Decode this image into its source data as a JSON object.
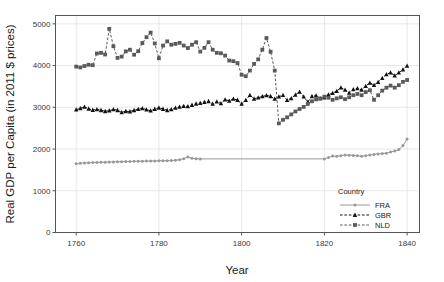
{
  "chart_data": {
    "type": "line",
    "title": "",
    "xlabel": "Year",
    "ylabel": "Real GDP per Capita (in 2011 $ prices)",
    "xlim": [
      1755,
      1843
    ],
    "ylim": [
      0,
      5200
    ],
    "xticks": [
      1760,
      1780,
      1800,
      1820,
      1840
    ],
    "yticks": [
      0,
      1000,
      2000,
      3000,
      4000,
      5000
    ],
    "grid": true,
    "legend_title": "Country",
    "legend_position": "inside-bottom-right",
    "series": [
      {
        "name": "FRA",
        "color": "#999999",
        "linestyle": "solid",
        "marker": "circle",
        "x": [
          1760,
          1761,
          1762,
          1763,
          1764,
          1765,
          1766,
          1767,
          1768,
          1769,
          1770,
          1771,
          1772,
          1773,
          1774,
          1775,
          1776,
          1777,
          1778,
          1779,
          1780,
          1781,
          1782,
          1783,
          1784,
          1785,
          1786,
          1787,
          1788,
          1789,
          1790,
          1820,
          1821,
          1822,
          1823,
          1824,
          1825,
          1826,
          1827,
          1828,
          1829,
          1830,
          1831,
          1832,
          1833,
          1834,
          1835,
          1836,
          1837,
          1838,
          1839,
          1840
        ],
        "values": [
          1648,
          1661,
          1668,
          1672,
          1676,
          1680,
          1684,
          1686,
          1690,
          1692,
          1696,
          1698,
          1700,
          1702,
          1705,
          1707,
          1710,
          1712,
          1714,
          1716,
          1718,
          1720,
          1722,
          1726,
          1730,
          1746,
          1769,
          1812,
          1780,
          1766,
          1764,
          1764,
          1800,
          1832,
          1826,
          1840,
          1858,
          1852,
          1846,
          1838,
          1828,
          1842,
          1858,
          1872,
          1884,
          1892,
          1902,
          1928,
          1952,
          1986,
          2082,
          2238
        ]
      },
      {
        "name": "GBR",
        "color": "#111111",
        "linestyle": "dashed",
        "marker": "triangle",
        "x": [
          1760,
          1761,
          1762,
          1763,
          1764,
          1765,
          1766,
          1767,
          1768,
          1769,
          1770,
          1771,
          1772,
          1773,
          1774,
          1775,
          1776,
          1777,
          1778,
          1779,
          1780,
          1781,
          1782,
          1783,
          1784,
          1785,
          1786,
          1787,
          1788,
          1789,
          1790,
          1791,
          1792,
          1793,
          1794,
          1795,
          1796,
          1797,
          1798,
          1799,
          1800,
          1801,
          1802,
          1803,
          1804,
          1805,
          1806,
          1807,
          1808,
          1809,
          1810,
          1811,
          1812,
          1813,
          1814,
          1815,
          1816,
          1817,
          1818,
          1819,
          1820,
          1821,
          1822,
          1823,
          1824,
          1825,
          1826,
          1827,
          1828,
          1829,
          1830,
          1831,
          1832,
          1833,
          1834,
          1835,
          1836,
          1837,
          1838,
          1839,
          1840
        ],
        "values": [
          2945,
          2975,
          3010,
          2965,
          2935,
          2950,
          2930,
          2905,
          2920,
          2950,
          2930,
          2880,
          2905,
          2900,
          2930,
          2955,
          2975,
          2945,
          2920,
          2960,
          2990,
          2960,
          2930,
          2950,
          2985,
          3010,
          3030,
          3020,
          3055,
          3085,
          3100,
          3125,
          3145,
          3080,
          3135,
          3095,
          3185,
          3155,
          3200,
          3175,
          3080,
          3170,
          3290,
          3205,
          3230,
          3260,
          3285,
          3265,
          3200,
          3255,
          3290,
          3170,
          3215,
          3300,
          3370,
          3255,
          3130,
          3265,
          3280,
          3215,
          3235,
          3305,
          3340,
          3390,
          3470,
          3420,
          3345,
          3430,
          3455,
          3420,
          3510,
          3585,
          3530,
          3605,
          3700,
          3790,
          3830,
          3760,
          3830,
          3905,
          3995
        ]
      },
      {
        "name": "NLD",
        "color": "#5a5a5a",
        "linestyle": "dashed",
        "marker": "square",
        "x": [
          1760,
          1761,
          1762,
          1763,
          1764,
          1765,
          1766,
          1767,
          1768,
          1769,
          1770,
          1771,
          1772,
          1773,
          1774,
          1775,
          1776,
          1777,
          1778,
          1779,
          1780,
          1781,
          1782,
          1783,
          1784,
          1785,
          1786,
          1787,
          1788,
          1789,
          1790,
          1791,
          1792,
          1793,
          1794,
          1795,
          1796,
          1797,
          1798,
          1799,
          1800,
          1801,
          1802,
          1803,
          1804,
          1805,
          1806,
          1807,
          1808,
          1809,
          1810,
          1811,
          1812,
          1813,
          1814,
          1815,
          1816,
          1817,
          1818,
          1819,
          1820,
          1821,
          1822,
          1823,
          1824,
          1825,
          1826,
          1827,
          1828,
          1829,
          1830,
          1831,
          1832,
          1833,
          1834,
          1835,
          1836,
          1837,
          1838,
          1839,
          1840
        ],
        "values": [
          3975,
          3955,
          3990,
          4020,
          4010,
          4290,
          4305,
          4265,
          4880,
          4465,
          4185,
          4215,
          4340,
          4380,
          4260,
          4345,
          4540,
          4680,
          4790,
          4530,
          4175,
          4480,
          4580,
          4500,
          4520,
          4545,
          4480,
          4420,
          4500,
          4560,
          4335,
          4425,
          4560,
          4380,
          4305,
          4295,
          4240,
          4120,
          4105,
          4060,
          3780,
          3745,
          3880,
          4040,
          4150,
          4380,
          4660,
          4330,
          3880,
          2615,
          2700,
          2760,
          2830,
          2900,
          2960,
          3010,
          3080,
          3145,
          3190,
          3210,
          3255,
          3230,
          3180,
          3215,
          3240,
          3195,
          3240,
          3290,
          3320,
          3290,
          3365,
          3410,
          3180,
          3290,
          3400,
          3470,
          3520,
          3470,
          3530,
          3610,
          3655
        ]
      }
    ]
  }
}
